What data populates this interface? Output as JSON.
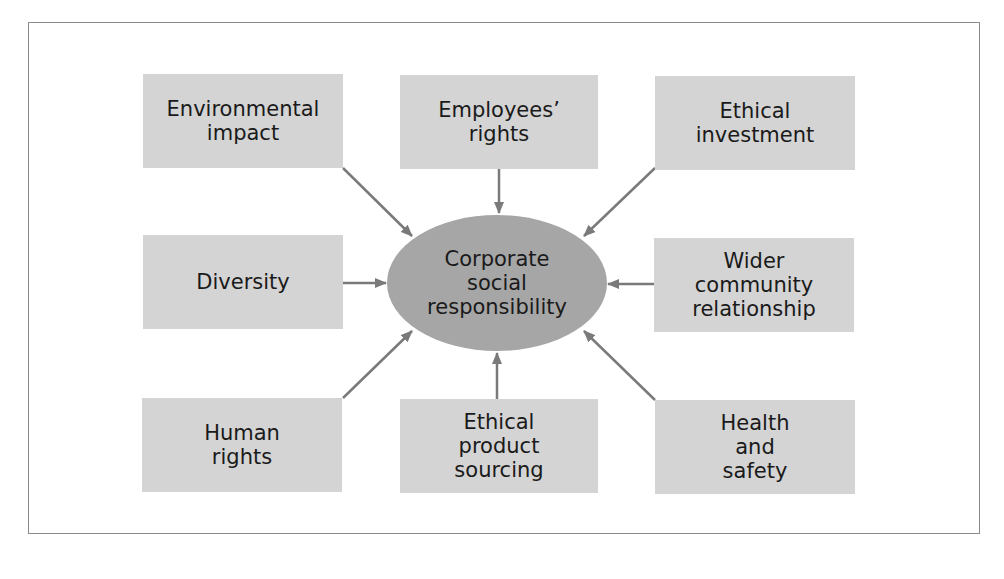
{
  "diagram": {
    "type": "hub-and-spoke",
    "center": {
      "label": "Corporate\nsocial\nresponsibility"
    },
    "nodes": [
      {
        "id": "environmental-impact",
        "label": "Environmental\nimpact"
      },
      {
        "id": "employees-rights",
        "label": "Employees’\nrights"
      },
      {
        "id": "ethical-investment",
        "label": "Ethical\ninvestment"
      },
      {
        "id": "diversity",
        "label": "Diversity"
      },
      {
        "id": "wider-community-relationship",
        "label": "Wider\ncommunity\nrelationship"
      },
      {
        "id": "human-rights",
        "label": "Human\nrights"
      },
      {
        "id": "ethical-product-sourcing",
        "label": "Ethical\nproduct\nsourcing"
      },
      {
        "id": "health-and-safety",
        "label": "Health\nand\nsafety"
      }
    ],
    "edges_direction": "node-to-center",
    "colors": {
      "box_fill": "#d4d4d4",
      "center_fill": "#a6a6a6",
      "arrow": "#7a7a7a",
      "frame": "#8a8a8a"
    }
  }
}
